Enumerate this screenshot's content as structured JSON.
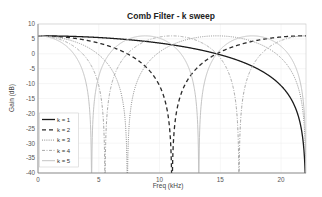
{
  "chart_data": {
    "type": "line",
    "title": "Comb Filter - k sweep",
    "xlabel": "Freq (kHz)",
    "ylabel": "Gain (dB)",
    "xlim": [
      0,
      22.05
    ],
    "ylim": [
      -40,
      10
    ],
    "xticks": [
      0,
      5,
      10,
      15,
      20
    ],
    "yticks": [
      10,
      5,
      0,
      -5,
      -10,
      -15,
      -20,
      -25,
      -30,
      -35,
      -40
    ],
    "grid": true,
    "legend_position": "lower left",
    "formula": "Gain = 20*log10(|2*cos(pi*f*k/fs)|), fs = 44.1 kHz",
    "sample_rate_khz": 44.1,
    "series": [
      {
        "name": "k = 1",
        "k": 1,
        "style": "solid",
        "color": "#1a1a1a",
        "width": 1.3,
        "peak_db": 6.02,
        "nulls_khz": [
          22.05
        ]
      },
      {
        "name": "k = 2",
        "k": 2,
        "style": "dashed",
        "color": "#2a2a2a",
        "width": 1.3,
        "peak_db": 6.02,
        "nulls_khz": [
          11.025
        ]
      },
      {
        "name": "k = 3",
        "k": 3,
        "style": "dotted",
        "color": "#8c8c8c",
        "width": 1.0,
        "peak_db": 6.02,
        "nulls_khz": [
          7.35,
          22.05
        ]
      },
      {
        "name": "k = 4",
        "k": 4,
        "style": "dashdot",
        "color": "#a8a8a8",
        "width": 1.0,
        "peak_db": 6.02,
        "nulls_khz": [
          5.5125,
          16.5375
        ]
      },
      {
        "name": "k = 5",
        "k": 5,
        "style": "solid",
        "color": "#c4c4c4",
        "width": 1.0,
        "peak_db": 6.02,
        "nulls_khz": [
          4.41,
          13.23,
          22.05
        ]
      }
    ]
  }
}
